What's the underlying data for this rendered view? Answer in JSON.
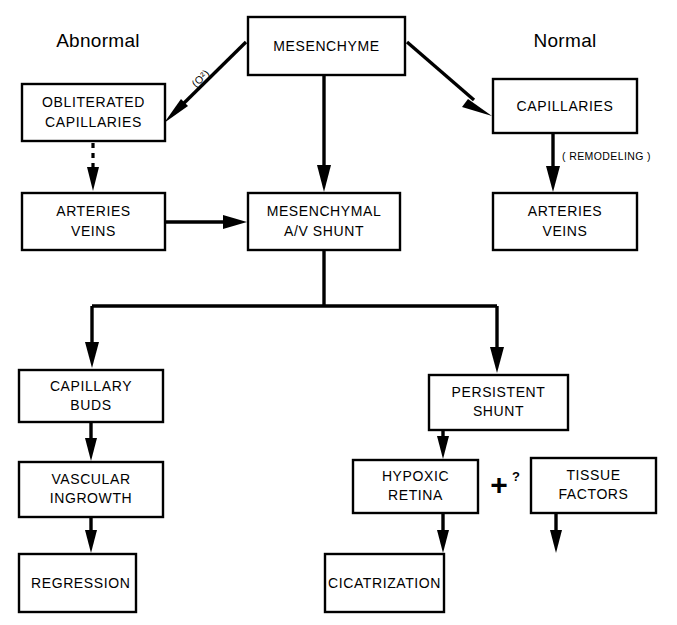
{
  "diagram": {
    "headings": {
      "left": "Abnormal",
      "right": "Normal"
    },
    "nodes": {
      "mesenchyme": "MESENCHYME",
      "obliterated_capillaries_line1": "OBLITERATED",
      "obliterated_capillaries_line2": "CAPILLARIES",
      "capillaries": "CAPILLARIES",
      "arteries_veins_left_line1": "ARTERIES",
      "arteries_veins_left_line2": "VEINS",
      "arteries_veins_right_line1": "ARTERIES",
      "arteries_veins_right_line2": "VEINS",
      "mesenchymal_shunt_line1": "MESENCHYMAL",
      "mesenchymal_shunt_line2": "A/V  SHUNT",
      "capillary_buds_line1": "CAPILLARY",
      "capillary_buds_line2": "BUDS",
      "vascular_ingrowth_line1": "VASCULAR",
      "vascular_ingrowth_line2": "INGROWTH",
      "regression": "REGRESSION",
      "persistent_shunt_line1": "PERSISTENT",
      "persistent_shunt_line2": "SHUNT",
      "hypoxic_retina_line1": "HYPOXIC",
      "hypoxic_retina_line2": "RETINA",
      "tissue_factors_line1": "TISSUE",
      "tissue_factors_line2": "FACTORS",
      "cicatrization": "CICATRIZATION"
    },
    "annotations": {
      "oxygen": "(O²)",
      "remodeling": "( REMODELING )",
      "plus": "+",
      "question": "?"
    },
    "colors": {
      "stroke": "#000000",
      "fill": "#ffffff",
      "background": "#ffffff"
    }
  }
}
